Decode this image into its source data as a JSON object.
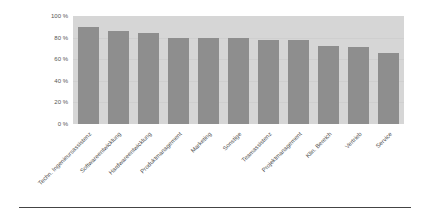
{
  "chart_data": {
    "type": "bar",
    "title": "",
    "xlabel": "",
    "ylabel": "",
    "ylim": [
      0,
      100
    ],
    "yticks": [
      "0 %",
      "20 %",
      "40 %",
      "60 %",
      "80 %",
      "100 %"
    ],
    "grid": true,
    "legend": null,
    "categories": [
      "Techn. Ingenieursassistenz",
      "Softwareentwicklung",
      "Hardwareentwicklung",
      "Produktmanagement",
      "Marketing",
      "Sonstige",
      "Teamassistenz",
      "Projektmanagement",
      "Klin. Bereich",
      "Vertrieb",
      "Service"
    ],
    "values": [
      90,
      86,
      84,
      80,
      80,
      80,
      78,
      78,
      72,
      71,
      66
    ],
    "colors": {
      "bar": "#8e8e8e",
      "plot_background": "#d6d6d6"
    }
  }
}
